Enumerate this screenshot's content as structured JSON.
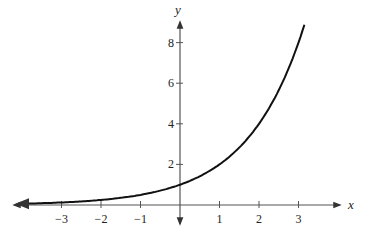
{
  "chart_data": {
    "type": "line",
    "title": "",
    "function": "y = 2^x",
    "xlabel": "x",
    "ylabel": "y",
    "xlim": [
      -4.1,
      4.3
    ],
    "ylim": [
      -0.8,
      9.5
    ],
    "x_ticks": [
      -3,
      -2,
      -1,
      1,
      2,
      3
    ],
    "x_tick_labels": [
      "−3",
      "−2",
      "−1",
      "1",
      "2",
      "3"
    ],
    "y_ticks": [
      2,
      4,
      6,
      8
    ],
    "y_tick_labels": [
      "2",
      "4",
      "6",
      "8"
    ],
    "grid": false,
    "legend": null,
    "series": [
      {
        "name": "y = 2^x",
        "x": [
          -4,
          -3,
          -2,
          -1,
          0,
          1,
          2,
          3,
          3.15
        ],
        "y": [
          0.0625,
          0.125,
          0.25,
          0.5,
          1,
          2,
          4,
          8,
          8.88
        ]
      }
    ]
  },
  "colors": {
    "axis": "#555555",
    "curve": "#111111",
    "text": "#222222"
  }
}
